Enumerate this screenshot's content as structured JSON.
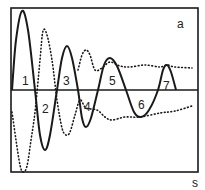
{
  "chart_data": {
    "type": "line",
    "title": "",
    "panel_label": "a",
    "xlabel": "s",
    "ylabel": "",
    "grid": false,
    "legend": null,
    "frame": {
      "x0": 11,
      "y0": 8,
      "x1": 198,
      "y1": 172,
      "baseline_y": 90
    },
    "series": [
      {
        "name": "damped oscillation (solid)",
        "style": "solid",
        "points": [
          [
            12,
            90
          ],
          [
            16,
            40
          ],
          [
            22,
            11
          ],
          [
            28,
            30
          ],
          [
            35,
            90
          ],
          [
            40,
            135
          ],
          [
            45,
            150
          ],
          [
            50,
            135
          ],
          [
            57,
            90
          ],
          [
            62,
            58
          ],
          [
            67,
            46
          ],
          [
            72,
            58
          ],
          [
            78,
            90
          ],
          [
            82,
            118
          ],
          [
            86,
            127
          ],
          [
            91,
            118
          ],
          [
            98,
            90
          ],
          [
            104,
            65
          ],
          [
            110,
            58
          ],
          [
            117,
            66
          ],
          [
            126,
            90
          ],
          [
            134,
            112
          ],
          [
            141,
            117
          ],
          [
            149,
            110
          ],
          [
            158,
            90
          ],
          [
            163,
            70
          ],
          [
            167,
            65
          ],
          [
            171,
            72
          ],
          [
            176,
            90
          ]
        ]
      },
      {
        "name": "response (dotted, lower branch)",
        "style": "dotted",
        "points": [
          [
            12,
            112
          ],
          [
            16,
            140
          ],
          [
            20,
            165
          ],
          [
            23,
            172
          ],
          [
            27,
            166
          ],
          [
            31,
            140
          ],
          [
            35,
            112
          ],
          [
            40,
            60
          ],
          [
            43,
            31
          ],
          [
            47,
            35
          ],
          [
            52,
            60
          ],
          [
            57,
            100
          ],
          [
            62,
            128
          ],
          [
            66,
            135
          ],
          [
            70,
            132
          ],
          [
            75,
            115
          ],
          [
            80,
            100
          ],
          [
            86,
            108
          ],
          [
            97,
            110
          ],
          [
            105,
            117
          ],
          [
            112,
            120
          ],
          [
            125,
            117
          ],
          [
            140,
            117
          ],
          [
            160,
            113
          ],
          [
            175,
            111
          ],
          [
            192,
            106
          ]
        ]
      },
      {
        "name": "response (dotted, upper branch)",
        "style": "dotted",
        "points": [
          [
            78,
            70
          ],
          [
            82,
            55
          ],
          [
            86,
            50
          ],
          [
            90,
            55
          ],
          [
            95,
            70
          ],
          [
            102,
            68
          ],
          [
            110,
            62
          ],
          [
            120,
            66
          ],
          [
            130,
            67
          ],
          [
            145,
            65
          ],
          [
            160,
            67
          ],
          [
            167,
            65
          ],
          [
            175,
            67
          ],
          [
            192,
            68
          ]
        ]
      }
    ],
    "lobe_labels": [
      {
        "text": "1",
        "x": 25,
        "y": 81
      },
      {
        "text": "2",
        "x": 45,
        "y": 109
      },
      {
        "text": "3",
        "x": 66,
        "y": 81
      },
      {
        "text": "4",
        "x": 87,
        "y": 107
      },
      {
        "text": "5",
        "x": 112,
        "y": 81
      },
      {
        "text": "6",
        "x": 141,
        "y": 105
      },
      {
        "text": "7",
        "x": 166,
        "y": 86
      }
    ]
  },
  "labels": {
    "panel": "a",
    "x_axis": "s",
    "lobes": [
      "1",
      "2",
      "3",
      "4",
      "5",
      "6",
      "7"
    ]
  },
  "colors": {
    "ink": "#1a1a1a",
    "background": "#ffffff"
  }
}
